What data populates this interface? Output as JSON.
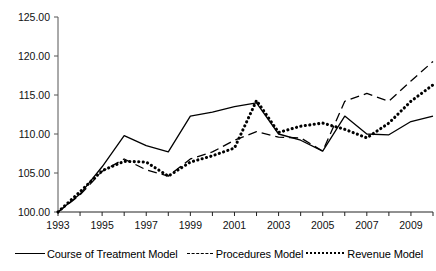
{
  "chart_data": {
    "type": "line",
    "title": "",
    "subtitle": "",
    "xlabel": "",
    "ylabel": "",
    "x": [
      1993,
      1994,
      1995,
      1996,
      1997,
      1998,
      1999,
      2000,
      2001,
      2002,
      2003,
      2004,
      2005,
      2006,
      2007,
      2008,
      2009,
      2010
    ],
    "xlim": [
      1993,
      2010
    ],
    "ylim": [
      100.0,
      125.0
    ],
    "yticks": [
      100.0,
      105.0,
      110.0,
      115.0,
      120.0,
      125.0
    ],
    "ytick_labels": [
      "100.00",
      "105.00",
      "110.00",
      "115.00",
      "120.00",
      "125.00"
    ],
    "xticks": [
      1993,
      1995,
      1997,
      1999,
      2001,
      2003,
      2005,
      2007,
      2009
    ],
    "xtick_labels": [
      "1993",
      "1995",
      "1997",
      "1999",
      "2001",
      "2003",
      "2005",
      "2007",
      "2009"
    ],
    "xminor_ticks": [
      1994,
      1996,
      1998,
      2000,
      2002,
      2004,
      2006,
      2008,
      2010
    ],
    "grid": false,
    "legend_position": "bottom",
    "series": [
      {
        "name": "Course of Treatment Model",
        "style": "solid",
        "color": "#000000",
        "values": [
          100.0,
          102.3,
          105.8,
          109.8,
          108.5,
          107.7,
          112.3,
          112.8,
          113.5,
          114.0,
          110.0,
          109.2,
          107.8,
          112.3,
          110.0,
          109.9,
          111.6,
          112.3
        ]
      },
      {
        "name": "Procedures Model",
        "style": "dashed",
        "color": "#000000",
        "values": [
          100.0,
          102.2,
          105.2,
          106.8,
          105.4,
          104.6,
          106.8,
          107.7,
          109.2,
          110.3,
          109.6,
          109.5,
          107.8,
          114.2,
          115.2,
          114.2,
          116.8,
          119.3
        ]
      },
      {
        "name": "Revenue Model",
        "style": "dotted",
        "color": "#000000",
        "values": [
          100.0,
          102.6,
          105.3,
          106.5,
          106.4,
          104.6,
          106.4,
          107.2,
          108.2,
          114.3,
          110.2,
          111.0,
          111.4,
          110.6,
          109.5,
          111.4,
          114.2,
          116.3
        ]
      }
    ]
  },
  "legend": {
    "entries": [
      {
        "label": "Course of Treatment Model",
        "style": "solid"
      },
      {
        "label": "Procedures Model",
        "style": "dashed"
      },
      {
        "label": "Revenue Model",
        "style": "dotted"
      }
    ]
  }
}
